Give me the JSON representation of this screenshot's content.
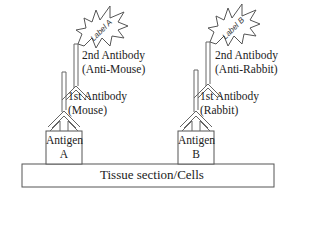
{
  "diagram": {
    "substrate": {
      "label": "Tissue section/Cells"
    },
    "left": {
      "antigen": {
        "line1": "Antigen",
        "line2": "A"
      },
      "primary": {
        "line1": "1st Antibody",
        "line2": "(Mouse)"
      },
      "secondary": {
        "line1": "2nd Antibody",
        "line2": "(Anti-Mouse)"
      },
      "label": "Label A"
    },
    "right": {
      "antigen": {
        "line1": "Antigen",
        "line2": "B"
      },
      "primary": {
        "line1": "1st Antibody",
        "line2": "(Rabbit)"
      },
      "secondary": {
        "line1": "2nd Antibody",
        "line2": "(Anti-Rabbit)"
      },
      "label": "Label B"
    }
  }
}
